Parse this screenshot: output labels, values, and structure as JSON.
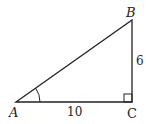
{
  "diagram": {
    "type": "right-triangle",
    "vertices": {
      "A": {
        "label": "A",
        "x": 16,
        "y": 102
      },
      "B": {
        "label": "B",
        "x": 132,
        "y": 20
      },
      "C": {
        "label": "C",
        "x": 132,
        "y": 102
      }
    },
    "sides": {
      "AC": {
        "label": "10"
      },
      "BC": {
        "label": "6"
      }
    },
    "angle_mark": "A",
    "right_angle": "C",
    "stroke_color": "#222222"
  }
}
